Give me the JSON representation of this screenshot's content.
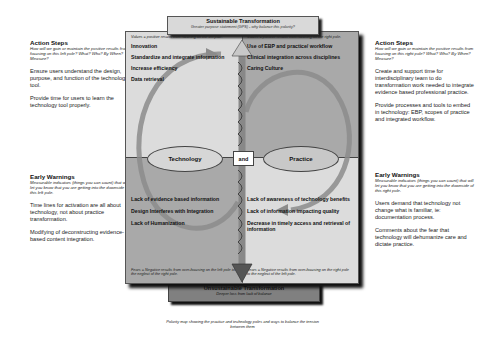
{
  "top": {
    "title": "Sustainable Transformation",
    "subtitle": "Greater purpose statement (GPS) - why balance this polarity?"
  },
  "bottom": {
    "title": "Unsustainable Transformation",
    "subtitle": "Deeper loss from lack of balance"
  },
  "poles": {
    "left": "Technology",
    "connector": "and",
    "right": "Practice"
  },
  "quadrants": {
    "top_left": {
      "note": "Values = positive results from focusing on the left pole.",
      "items": [
        "Innovation",
        "Standardize and integrate information",
        "Increase efficiency",
        "Data retrieval"
      ]
    },
    "top_right": {
      "note": "Values = positive results from focusing on the right pole.",
      "items": [
        "Use of EBP and practice/ workflow",
        "Clinical integration across disciplines",
        "Caring Culture"
      ]
    },
    "bottom_left": {
      "items": [
        "Lack of evidence based information",
        "Design Interferes with Integration",
        "Lack of Humanization"
      ],
      "note": "Fears = Negative results from over-focusing on the left pole to the neglect of the right pole."
    },
    "bottom_right": {
      "items": [
        "Lack of awareness of technology benefits",
        "Lack of information impacting quality",
        "Decrease in timely access and retrieval of information"
      ],
      "note": "Fears = Negative results from over-focusing on the right pole to the neglect of the left pole."
    }
  },
  "left_panel": {
    "action_steps": {
      "title": "Action Steps",
      "subtitle": "How will we gain or maintain the positive results from focusing on this left pole? What? Who? By When? Measure?",
      "items": [
        "Ensure users understand the design, purpose, and function of the technology tool.",
        "Provide time for users to learn the technology tool properly."
      ]
    },
    "early_warnings": {
      "title": "Early Warnings",
      "subtitle": "Measurable indicators (things you can count) that will let you know that you are getting into the downside of this left pole.",
      "items": [
        "Time lines for activation are all about technology, not about practice transformation.",
        "Modifying of deconstructing evidence-based content integration."
      ]
    }
  },
  "right_panel": {
    "action_steps": {
      "title": "Action Steps",
      "subtitle": "How will we gain or maintain the positive results from focusing on this right pole? What? Who? By When? Measure?",
      "items": [
        "Create and support time for interdisciplinary team to do transformation work needed to integrate evidence based professional practice.",
        "Provide processes and tools to embed in technology: EBP, scopes of practice and integrated workflow."
      ]
    },
    "early_warnings": {
      "title": "Early Warnings",
      "subtitle": "Measurable indicators (things you can count) that will let you know that you are getting into the downside of this right pole.",
      "items": [
        "Users demand that technology not change what is familiar, ie: documentation process.",
        "Comments about the fear that technology will dehumanize care and dictate practice."
      ]
    }
  },
  "caption": "Polarity map showing the practice and technology poles and ways to balance the tension between them",
  "colors": {
    "light_quadrant": "#dcdcdc",
    "dark_quadrant": "#a9a9a9",
    "bottom_box": "#808080",
    "arrow": "#8c8c8c"
  }
}
